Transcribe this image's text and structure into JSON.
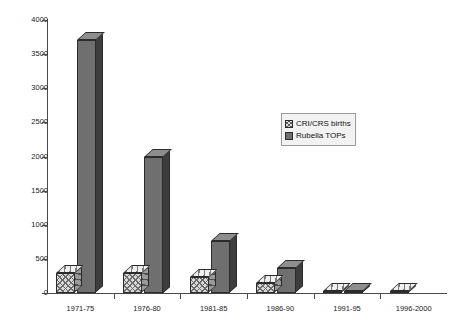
{
  "chart_data": {
    "type": "bar",
    "title": "",
    "subtitle": "",
    "xlabel": "",
    "ylabel": "",
    "categories": [
      "1971-75",
      "1976-80",
      "1981-85",
      "1986-90",
      "1991-95",
      "1996-2000"
    ],
    "series": [
      {
        "name": "CRI/CRS births",
        "pattern": "hatched",
        "color": "#d8d8d8",
        "values": [
          300,
          290,
          230,
          150,
          25,
          20
        ]
      },
      {
        "name": "Rubella TOPs",
        "pattern": "solid",
        "color": "#6f6f6f",
        "values": [
          3700,
          2000,
          760,
          370,
          30,
          15
        ]
      }
    ],
    "ylim": [
      0,
      4000
    ],
    "ytick_labels": [
      "0",
      "500",
      "1000",
      "1500",
      "2000",
      "2500",
      "3000",
      "3500",
      "4000"
    ],
    "ytick_values": [
      0,
      500,
      1000,
      1500,
      2000,
      2500,
      3000,
      3500,
      4000
    ],
    "grid": false,
    "legend_position": "center-right",
    "style_3d": true,
    "background": "#ffffff"
  },
  "legend": {
    "entries": [
      {
        "label": "CRI/CRS births"
      },
      {
        "label": "Rubella TOPs"
      }
    ]
  }
}
